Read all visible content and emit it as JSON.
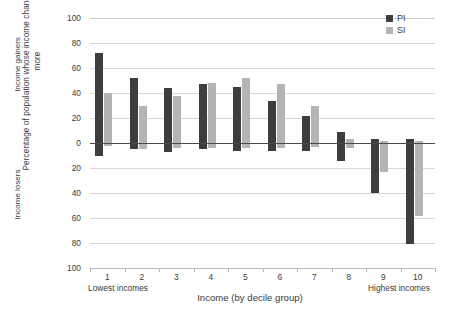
{
  "chart_data": {
    "type": "bar",
    "title": "",
    "xlabel": "Income (by decile group)",
    "ylabel": "Percentage of population whose income changes by 5% or more",
    "upper_axis_label": "Income gainers",
    "lower_axis_label": "Income losers",
    "xlim_note": "Lowest incomes",
    "xlim_note_right": "Highest incomes",
    "categories": [
      "1",
      "2",
      "3",
      "4",
      "5",
      "6",
      "7",
      "8",
      "9",
      "10"
    ],
    "yticks_upper": [
      "100",
      "80",
      "60",
      "40",
      "20",
      "0"
    ],
    "yticks_lower": [
      "20",
      "40",
      "60",
      "80",
      "100"
    ],
    "yticks_all": [
      "100",
      "80",
      "60",
      "40",
      "20",
      "0",
      "20",
      "40",
      "60",
      "80",
      "100"
    ],
    "ylim": [
      -100,
      100
    ],
    "grid": true,
    "legend_position": "top-right",
    "series": [
      {
        "name": "PI",
        "color": "#3d3d3d",
        "gainers": [
          72,
          52,
          44,
          47,
          45,
          34,
          22,
          9,
          3,
          3
        ],
        "losers": [
          -10,
          -5,
          -7,
          -5,
          -6,
          -6,
          -6,
          -14,
          -40,
          -81
        ]
      },
      {
        "name": "SI",
        "color": "#b4b4b4",
        "gainers": [
          40,
          30,
          38,
          48,
          52,
          47,
          30,
          3,
          2,
          2
        ],
        "losers": [
          -2,
          -5,
          -4,
          -4,
          -4,
          -4,
          -3,
          -4,
          -23,
          -58
        ]
      }
    ]
  },
  "axis": {
    "ylabel_outer": "Percentage of population whose income changes by 5% or more",
    "ylabel_gainers": "Income gainers",
    "ylabel_losers": "Income losers",
    "xlabel": "Income (by decile group)",
    "lowest_note": "Lowest incomes",
    "highest_note": "Highest incomes"
  },
  "legend": {
    "items": [
      {
        "label": "PI",
        "color": "#3d3d3d"
      },
      {
        "label": "SI",
        "color": "#b4b4b4"
      }
    ]
  },
  "colors": {
    "pi": "#3d3d3d",
    "si": "#b4b4b4",
    "grid": "#d7d7d7",
    "zero_line": "#4a4a4a",
    "text": "#3b3b3b",
    "background": "#ffffff"
  }
}
